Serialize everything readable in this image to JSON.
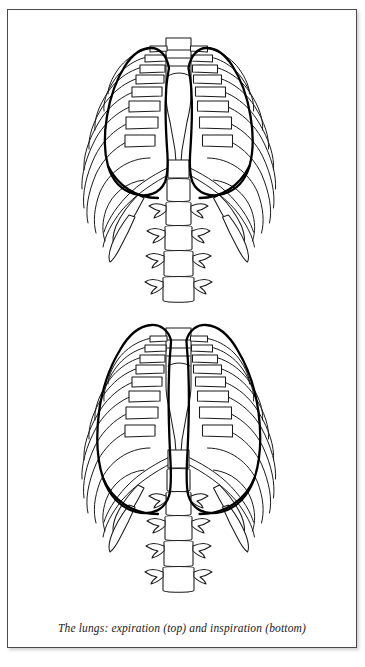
{
  "page": {
    "background_color": "#ffffff",
    "width": 365,
    "height": 667
  },
  "figure": {
    "frame": {
      "border_color": "#4a4a4a",
      "background_color": "#ffffff",
      "has_drop_shadow": true
    },
    "caption": "The lungs: expiration (top) and inspiration (bottom)",
    "caption_style": "italic-serif",
    "panels": [
      {
        "id": "top",
        "name": "expiration",
        "label_in_caption": "top",
        "description": "Rib cage with lung borders in expiration; lungs appear smaller and higher, mediastinal borders bowed toward midline",
        "lung_outline_weight": "bold",
        "rib_pairs": 10,
        "lumbar_vertebrae": 5
      },
      {
        "id": "bottom",
        "name": "inspiration",
        "label_in_caption": "bottom",
        "description": "Rib cage with lung borders in inspiration; lungs appear larger, extending lower and laterally",
        "lung_outline_weight": "bold",
        "rib_pairs": 10,
        "lumbar_vertebrae": 5
      }
    ],
    "colors": {
      "bone_stroke": "#1a1a1a",
      "lung_stroke": "#000000",
      "fill": "#ffffff"
    },
    "anatomy_parts": [
      "lung apex",
      "sternum (manubrium and body)",
      "xiphoid process",
      "ribs",
      "costal cartilage",
      "costal margin",
      "floating ribs",
      "lumbar vertebrae",
      "transverse processes"
    ]
  }
}
